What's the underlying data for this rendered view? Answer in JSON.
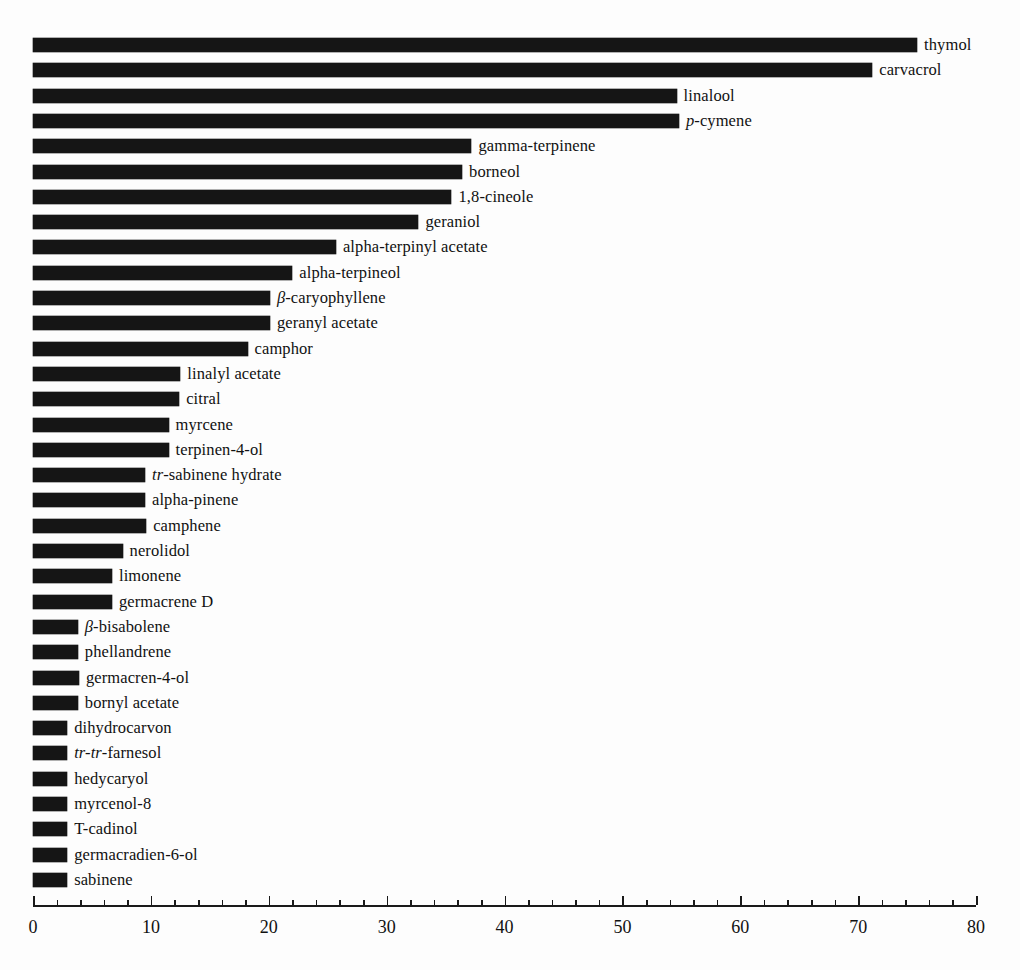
{
  "chart_data": {
    "type": "bar",
    "orientation": "horizontal",
    "title": "",
    "xlabel": "",
    "ylabel": "",
    "xlim": [
      0,
      80
    ],
    "xticks": [
      0,
      10,
      20,
      30,
      40,
      50,
      60,
      70,
      80
    ],
    "xtick_labels": [
      "0",
      "10",
      "20",
      "30",
      "40",
      "50",
      "60",
      "70",
      "80"
    ],
    "minor_tick_interval": 2,
    "grid": false,
    "legend": null,
    "bar_color": "#151515",
    "background_color": "#fdfdfd",
    "categories": [
      "thymol",
      "carvacrol",
      "linalool",
      "p-cymene",
      "gamma-terpinene",
      "borneol",
      "1,8-cineole",
      "geraniol",
      "alpha-terpinyl acetate",
      "alpha-terpineol",
      "β-caryophyllene",
      "geranyl acetate",
      "camphor",
      "linalyl acetate",
      "citral",
      "myrcene",
      "terpinen-4-ol",
      "tr-sabinene hydrate",
      "alpha-pinene",
      "camphene",
      "nerolidol",
      "limonene",
      "germacrene D",
      "β-bisabolene",
      "phellandrene",
      "germacren-4-ol",
      "bornyl acetate",
      "dihydrocarvon",
      "tr-tr-farnesol",
      "hedycaryol",
      "myrcenol-8",
      "T-cadinol",
      "germacradien-6-ol",
      "sabinene"
    ],
    "values": [
      75.0,
      71.2,
      54.6,
      54.8,
      37.2,
      36.4,
      35.5,
      32.7,
      25.7,
      22.0,
      20.1,
      20.1,
      18.2,
      12.5,
      12.4,
      11.5,
      11.5,
      9.5,
      9.5,
      9.6,
      7.6,
      6.7,
      6.7,
      3.8,
      3.8,
      3.9,
      3.8,
      2.9,
      2.9,
      2.9,
      2.9,
      2.9,
      2.9,
      2.9
    ],
    "labels_markup": [
      "thymol",
      "carvacrol",
      "linalool",
      "<i>p</i>-cymene",
      "gamma-terpinene",
      "borneol",
      "1,8-cineole",
      "geraniol",
      "alpha-terpinyl acetate",
      "alpha-terpineol",
      "<i>β</i>-caryophyllene",
      "geranyl acetate",
      "camphor",
      "linalyl acetate",
      "citral",
      "myrcene",
      "terpinen-4-ol",
      "<i>tr</i>-sabinene hydrate",
      "alpha-pinene",
      "camphene",
      "nerolidol",
      "limonene",
      "germacrene D",
      "<i>β</i>-bisabolene",
      "phellandrene",
      "germacren-4-ol",
      "bornyl acetate",
      "dihydrocarvon",
      "<i>tr-tr</i>-farnesol",
      "hedycaryol",
      "myrcenol-8",
      "T-cadinol",
      "germacradien-6-ol",
      "sabinene"
    ]
  },
  "caption": {
    "cropped_text": ""
  }
}
